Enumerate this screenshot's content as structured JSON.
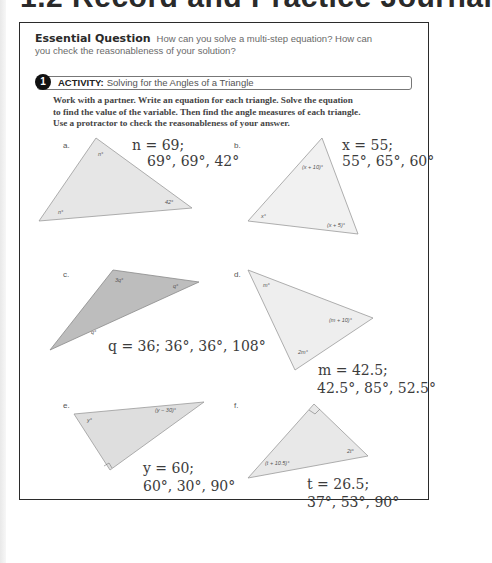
{
  "page": {
    "title": "1.2 Record and Practice Journal"
  },
  "essential_question": {
    "label": "Essential Question",
    "line1": "How can you solve a multi-step equation? How can",
    "line2": "you check the reasonableness of your solution?"
  },
  "activity": {
    "number": "1",
    "keyword": "ACTIVITY:",
    "title": "Solving for the Angles of a Triangle",
    "instructions": [
      "Work with a partner. Write an equation for each triangle. Solve the equation",
      "to find the value of the variable. Then find the angle measures of each triangle.",
      "Use a protractor to check the reasonableness of your answer."
    ]
  },
  "problems": [
    {
      "label": "a.",
      "fill": "#e6e6e6",
      "angles": [
        "n°",
        "n°",
        "42°"
      ],
      "answer_line1": "n = 69;",
      "answer_line2": "69°, 69°, 42°"
    },
    {
      "label": "b.",
      "fill": "#f1f1f1",
      "angles": [
        "(x + 10)°",
        "x°",
        "(x + 5)°"
      ],
      "answer_line1": "x = 55;",
      "answer_line2": "55°, 65°, 60°"
    },
    {
      "label": "c.",
      "fill": "#bdbdbd",
      "angles": [
        "3q°",
        "q°",
        "q°"
      ],
      "answer_line1": "q = 36; 36°, 36°, 108°",
      "answer_line2": ""
    },
    {
      "label": "d.",
      "fill": "#eeeeee",
      "angles": [
        "m°",
        "(m + 10)°",
        "2m°"
      ],
      "answer_line1": "m = 42.5;",
      "answer_line2": "42.5°, 85°, 52.5°"
    },
    {
      "label": "e.",
      "fill": "#dedede",
      "angles": [
        "y°",
        "(y − 30)°"
      ],
      "answer_line1": "y = 60;",
      "answer_line2": "60°, 30°, 90°"
    },
    {
      "label": "f.",
      "fill": "#e8e8e8",
      "angles": [
        "(t + 10.5)°",
        "2t°"
      ],
      "answer_line1": "t = 26.5;",
      "answer_line2": "37°, 53°, 90°"
    }
  ]
}
